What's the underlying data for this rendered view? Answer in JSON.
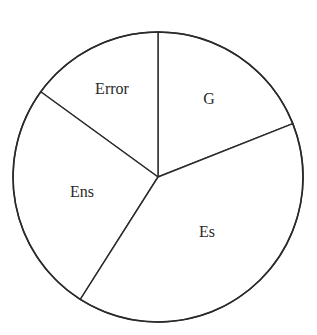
{
  "chart_data": {
    "type": "pie",
    "title": "",
    "categories": [
      "G",
      "Error",
      "Ens",
      "Es"
    ],
    "values": [
      19,
      15,
      26,
      40
    ],
    "unit": "percent (estimated from sector angles)",
    "start_angle_deg": 21.6,
    "direction": "counterclockwise",
    "legend": "none (labels inside slices)",
    "colors": {
      "fill": "#ffffff",
      "stroke": "#2a2a2a"
    }
  },
  "labels": {
    "g": "G",
    "error": "Error",
    "ens": "Ens",
    "es": "Es"
  }
}
